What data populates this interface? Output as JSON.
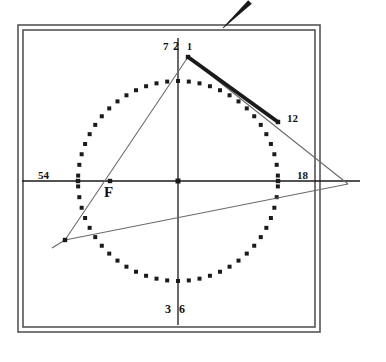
{
  "figure": {
    "background_color": "#ffffff",
    "ink_color": "#1a1a1a",
    "frame_color": "#555555",
    "thin_line_color": "#6b6b6b"
  },
  "frame": {
    "outer": {
      "x": 18,
      "y": 25,
      "width": 302,
      "height": 307
    },
    "inner": {
      "x": 23,
      "y": 30,
      "width": 292,
      "height": 297
    }
  },
  "circle": {
    "name": "dotted-circle",
    "center": {
      "x": 178,
      "y": 181
    },
    "radius": 100,
    "dot_count": 58,
    "dot_size": 4,
    "dot_shape": "square"
  },
  "axes": {
    "horizontal": {
      "x1": 22,
      "y1": 181,
      "x2": 360,
      "y2": 181
    },
    "vertical": {
      "x1": 178,
      "y1": 38,
      "x2": 178,
      "y2": 325
    },
    "center_marker": {
      "x": 178,
      "y": 181,
      "size": 5
    }
  },
  "points": [
    {
      "id": "top-vertex",
      "x": 188,
      "y": 57,
      "marked": true
    },
    {
      "id": "point-12",
      "x": 278,
      "y": 122,
      "marked": true
    },
    {
      "id": "point-F",
      "x": 110,
      "y": 181,
      "marked": true
    },
    {
      "id": "lower-left-vertex",
      "x": 65,
      "y": 240,
      "marked": true
    },
    {
      "id": "right-apex",
      "x": 348,
      "y": 184,
      "marked": false
    },
    {
      "id": "circle-left",
      "x": 78,
      "y": 181,
      "marked": true
    },
    {
      "id": "circle-right",
      "x": 278,
      "y": 181,
      "marked": true
    }
  ],
  "thick_segment": {
    "name": "bold-chord",
    "x1": 188,
    "y1": 57,
    "x2": 278,
    "y2": 122,
    "stroke_width": 4
  },
  "thin_lines": [
    {
      "name": "triangle-left-side",
      "x1": 188,
      "y1": 57,
      "x2": 65,
      "y2": 240
    },
    {
      "name": "triangle-base",
      "x1": 65,
      "y1": 240,
      "x2": 348,
      "y2": 184
    },
    {
      "name": "triangle-right-side",
      "x1": 188,
      "y1": 57,
      "x2": 348,
      "y2": 184
    },
    {
      "name": "left-tail",
      "x1": 65,
      "y1": 240,
      "x2": 52,
      "y2": 248
    }
  ],
  "pen_stroke": {
    "name": "pen-tip-mark",
    "x1": 223,
    "y1": 28,
    "x2": 250,
    "y2": 2
  },
  "labels": [
    {
      "id": "label-7",
      "text": "7",
      "x": 163,
      "y": 41,
      "size": 11
    },
    {
      "id": "label-2",
      "text": "2",
      "x": 173,
      "y": 40,
      "size": 12
    },
    {
      "id": "label-1",
      "text": "1",
      "x": 187,
      "y": 42,
      "size": 10
    },
    {
      "id": "label-3",
      "text": "3",
      "x": 165,
      "y": 303,
      "size": 12
    },
    {
      "id": "label-6",
      "text": "6",
      "x": 179,
      "y": 303,
      "size": 12
    },
    {
      "id": "label-54",
      "text": "54",
      "x": 38,
      "y": 170,
      "size": 11
    },
    {
      "id": "label-18",
      "text": "18",
      "x": 297,
      "y": 170,
      "size": 11
    },
    {
      "id": "label-12",
      "text": "12",
      "x": 287,
      "y": 113,
      "size": 11
    },
    {
      "id": "label-F",
      "text": "F",
      "x": 104,
      "y": 185,
      "size": 15
    }
  ]
}
